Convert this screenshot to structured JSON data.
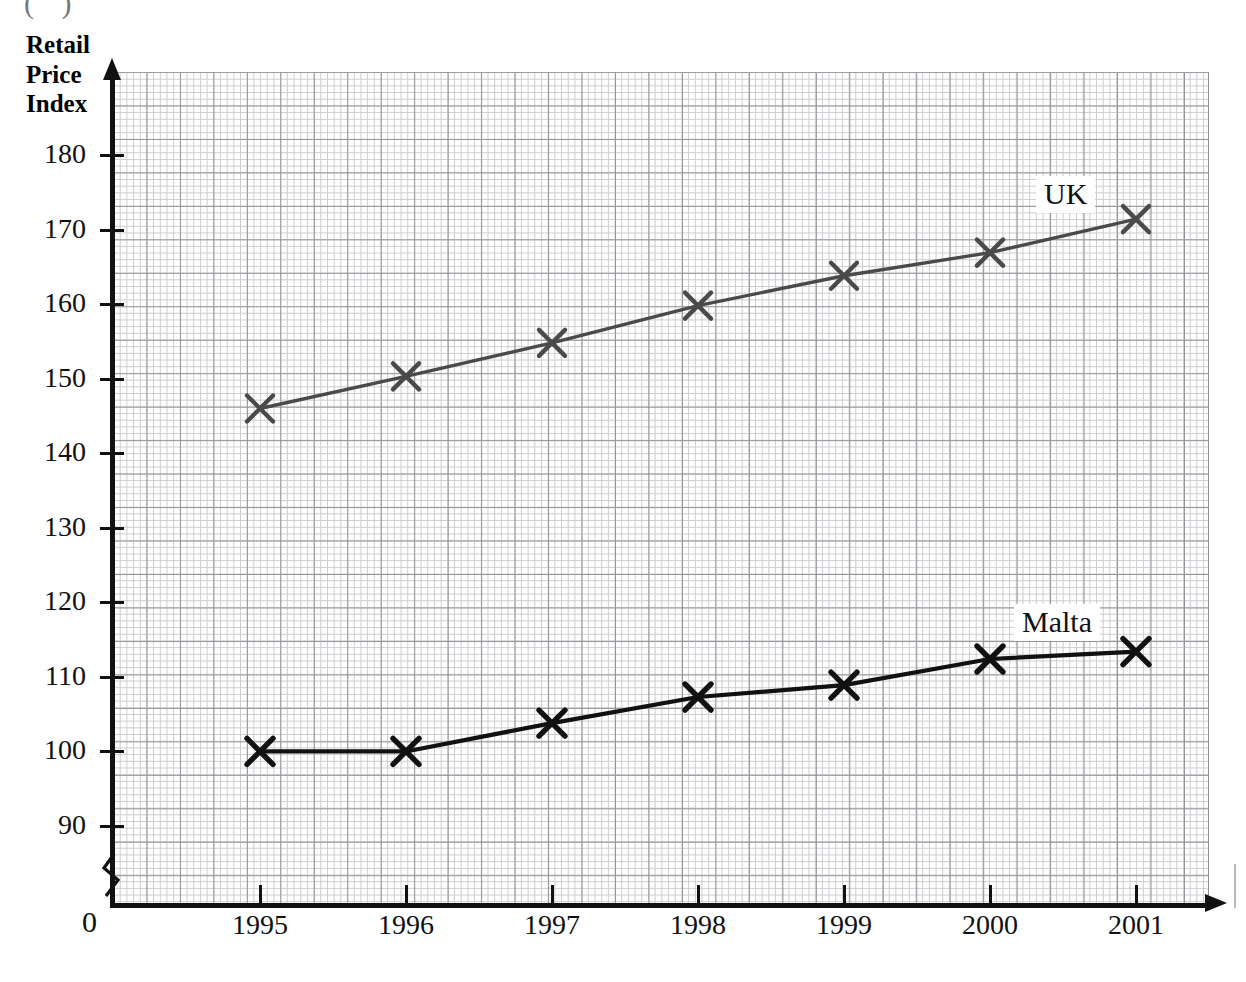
{
  "page": {
    "top_fragment": "( )",
    "background_color": "#ffffff"
  },
  "axis_title": {
    "line1": "Retail",
    "line2": "Price",
    "line3": "Index"
  },
  "origin_label": "0",
  "chart_data": {
    "type": "line",
    "title": "Retail Price Index",
    "xlabel": "",
    "ylabel": "Retail Price Index",
    "grid": true,
    "grid_style": "graph-paper, minor 0.4 units, major 2 units",
    "y_axis_break": true,
    "legend": "inline-labels",
    "xlim": [
      1994.5,
      2001.5
    ],
    "ylim": [
      86,
      184
    ],
    "x": [
      1995,
      1996,
      1997,
      1998,
      1999,
      2000,
      2001
    ],
    "categories": [
      "1995",
      "1996",
      "1997",
      "1998",
      "1999",
      "2000",
      "2001"
    ],
    "yticks": [
      90,
      100,
      110,
      120,
      130,
      140,
      150,
      160,
      170,
      180
    ],
    "ytick_labels": [
      "90",
      "100",
      "110",
      "120",
      "130",
      "140",
      "150",
      "160",
      "170",
      "180"
    ],
    "xtick_labels": [
      "1995",
      "1996",
      "1997",
      "1998",
      "1999",
      "2000",
      "2001"
    ],
    "series": [
      {
        "name": "UK",
        "label": "UK",
        "color": "#4a4a4a",
        "marker": "x",
        "values": [
          146,
          150.3,
          154.8,
          159.8,
          163.8,
          166.9,
          171.4
        ]
      },
      {
        "name": "Malta",
        "label": "Malta",
        "color": "#111111",
        "marker": "x",
        "values": [
          100,
          100,
          103.8,
          107.3,
          108.9,
          112.4,
          113.4
        ]
      }
    ]
  }
}
